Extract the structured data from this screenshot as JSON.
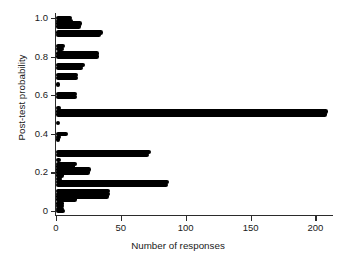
{
  "chart_data": {
    "type": "bar",
    "orientation": "horizontal",
    "title": "",
    "xlabel": "Number of responses",
    "ylabel": "Post-test probability",
    "xlim": [
      0,
      212
    ],
    "ylim": [
      -0.02,
      1.02
    ],
    "xticks": [
      0,
      50,
      100,
      150,
      200
    ],
    "xtick_labels": [
      "0",
      "50",
      "100",
      "150",
      "200"
    ],
    "yticks": [
      0,
      0.2,
      0.4,
      0.6,
      0.8,
      1.0
    ],
    "ytick_labels": [
      "0",
      "0.2",
      "0.4",
      "0.6",
      "0.8",
      "1.0"
    ],
    "grid": false,
    "legend": false,
    "bar_color": "#000000",
    "points": [
      {
        "y": 1.0,
        "value": 12
      },
      {
        "y": 0.985,
        "value": 13
      },
      {
        "y": 0.97,
        "value": 20
      },
      {
        "y": 0.955,
        "value": 19
      },
      {
        "y": 0.925,
        "value": 36
      },
      {
        "y": 0.91,
        "value": 35
      },
      {
        "y": 0.855,
        "value": 7
      },
      {
        "y": 0.84,
        "value": 6
      },
      {
        "y": 0.815,
        "value": 33
      },
      {
        "y": 0.8,
        "value": 33
      },
      {
        "y": 0.755,
        "value": 22
      },
      {
        "y": 0.74,
        "value": 21
      },
      {
        "y": 0.705,
        "value": 17
      },
      {
        "y": 0.69,
        "value": 17
      },
      {
        "y": 0.655,
        "value": 3
      },
      {
        "y": 0.605,
        "value": 16
      },
      {
        "y": 0.59,
        "value": 16
      },
      {
        "y": 0.535,
        "value": 4
      },
      {
        "y": 0.515,
        "value": 210
      },
      {
        "y": 0.5,
        "value": 209
      },
      {
        "y": 0.455,
        "value": 3
      },
      {
        "y": 0.4,
        "value": 9
      },
      {
        "y": 0.385,
        "value": 4
      },
      {
        "y": 0.37,
        "value": 3
      },
      {
        "y": 0.305,
        "value": 73
      },
      {
        "y": 0.29,
        "value": 72
      },
      {
        "y": 0.265,
        "value": 4
      },
      {
        "y": 0.245,
        "value": 16
      },
      {
        "y": 0.23,
        "value": 15
      },
      {
        "y": 0.215,
        "value": 27
      },
      {
        "y": 0.2,
        "value": 26
      },
      {
        "y": 0.185,
        "value": 6
      },
      {
        "y": 0.165,
        "value": 5
      },
      {
        "y": 0.15,
        "value": 87
      },
      {
        "y": 0.135,
        "value": 86
      },
      {
        "y": 0.105,
        "value": 42
      },
      {
        "y": 0.09,
        "value": 42
      },
      {
        "y": 0.075,
        "value": 41
      },
      {
        "y": 0.06,
        "value": 16
      },
      {
        "y": 0.04,
        "value": 6
      },
      {
        "y": 0.025,
        "value": 6
      },
      {
        "y": 0.01,
        "value": 6
      },
      {
        "y": 0.0,
        "value": 7
      }
    ]
  }
}
